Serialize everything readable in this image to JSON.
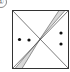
{
  "figure": {
    "label": "①",
    "square": {
      "x": 12.5,
      "y": 10.5,
      "w": 56,
      "h": 58
    },
    "colors": {
      "stroke": "#333333",
      "shade": "#d9d9d9",
      "dot": "#111111"
    },
    "dots": [
      {
        "cx": 19.5,
        "cy": 39.5
      },
      {
        "cx": 29,
        "cy": 40
      },
      {
        "cx": 61,
        "cy": 33
      },
      {
        "cx": 61,
        "cy": 44
      }
    ]
  }
}
